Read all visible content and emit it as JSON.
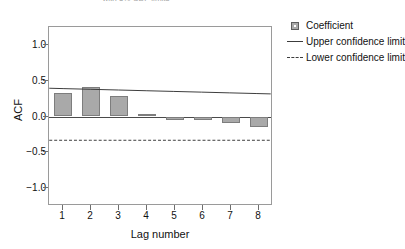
{
  "chart_data": {
    "type": "bar",
    "title": "with 5% CDF limits",
    "xlabel": "Lag number",
    "ylabel": "ACF",
    "categories": [
      1,
      2,
      3,
      4,
      5,
      6,
      7,
      8
    ],
    "values": [
      0.33,
      0.41,
      0.28,
      0.03,
      -0.05,
      -0.05,
      -0.09,
      -0.15
    ],
    "series": [
      {
        "name": "Coefficient",
        "type": "bar",
        "values": [
          0.33,
          0.41,
          0.28,
          0.03,
          -0.05,
          -0.05,
          -0.09,
          -0.15
        ]
      },
      {
        "name": "Upper confidence limit",
        "type": "line",
        "style": "solid",
        "values": [
          0.38,
          0.37,
          0.36,
          0.35,
          0.34,
          0.33,
          0.32,
          0.31
        ]
      },
      {
        "name": "Lower confidence limit",
        "type": "line",
        "style": "dashed",
        "values": [
          -0.35,
          -0.35,
          -0.35,
          -0.35,
          -0.35,
          -0.35,
          -0.35,
          -0.35
        ]
      }
    ],
    "ylim": [
      -1.25,
      1.25
    ],
    "yticks": [
      "1.0",
      "0.5",
      "0.0",
      "-0.5",
      "-1.0"
    ],
    "ytick_values": [
      1.0,
      0.5,
      0.0,
      -0.5,
      -1.0
    ],
    "xticks": [
      "1",
      "2",
      "3",
      "4",
      "5",
      "6",
      "7",
      "8"
    ],
    "xlim": [
      0.5,
      8.5
    ],
    "grid": false,
    "legend_position": "right",
    "colors": {
      "bar_fill": "#a9a9a9",
      "bar_edge": "#7d7d7d",
      "axis": "#6e6e6e",
      "frame": "#9a9a9a",
      "zero_line": "#4a4a4a",
      "conf_line": "#3c3c3c",
      "text": "#111111",
      "background": "#ffffff"
    }
  },
  "legend": {
    "items": [
      {
        "label": "Coefficient",
        "key": "box-swatch"
      },
      {
        "label": "Upper confidence limit",
        "key": "solid-line-swatch"
      },
      {
        "label": "Lower confidence limit",
        "key": "dashed-line-swatch"
      }
    ]
  }
}
